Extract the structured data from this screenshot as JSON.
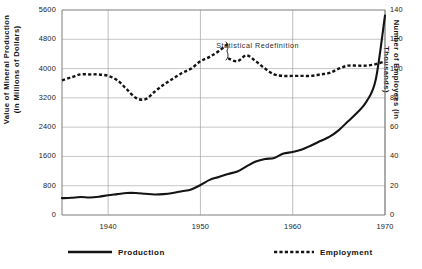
{
  "chart_data": {
    "type": "line",
    "title": "",
    "xlabel": "",
    "ylabel": "Value of Mineral Production\n(in Millions of Dollars)",
    "y2label": "Number of Employees (in Thousands)",
    "xlim": [
      1935,
      1970
    ],
    "ylim": [
      0,
      5600
    ],
    "y2lim": [
      0,
      140
    ],
    "grid": true,
    "legend_position": "bottom",
    "xticks": [
      1940,
      1950,
      1960,
      1970
    ],
    "xtick_labels": [
      "1940",
      "1950",
      "1960",
      "1970"
    ],
    "yticks": [
      0,
      800,
      1600,
      2400,
      3200,
      4000,
      4800,
      5600
    ],
    "ytick_labels": [
      "0",
      "800",
      "1600",
      "2400",
      "3200",
      "4000",
      "4800",
      "5600"
    ],
    "y2ticks": [
      0,
      20,
      40,
      60,
      80,
      100,
      120,
      140
    ],
    "y2tick_labels": [
      "0",
      "20",
      "40",
      "60",
      "80",
      "100",
      "120",
      "140"
    ],
    "annotations": [
      {
        "text": "Statistical Redefinition",
        "x": 1951.5,
        "y2": 116
      }
    ],
    "series": [
      {
        "name": "Production",
        "axis": "left",
        "style": "solid",
        "color": "#141414",
        "x": [
          1935,
          1936,
          1937,
          1938,
          1939,
          1940,
          1941,
          1942,
          1943,
          1944,
          1945,
          1946,
          1947,
          1948,
          1949,
          1950,
          1951,
          1952,
          1953,
          1954,
          1955,
          1956,
          1957,
          1958,
          1959,
          1960,
          1961,
          1962,
          1963,
          1964,
          1965,
          1966,
          1967,
          1968,
          1969,
          1970
        ],
        "y": [
          460,
          470,
          490,
          480,
          500,
          540,
          570,
          600,
          600,
          580,
          560,
          570,
          600,
          650,
          700,
          820,
          960,
          1040,
          1120,
          1190,
          1330,
          1460,
          1530,
          1560,
          1680,
          1720,
          1790,
          1900,
          2020,
          2140,
          2320,
          2560,
          2800,
          3100,
          3700,
          5450
        ]
      },
      {
        "name": "Employment",
        "axis": "right",
        "style": "dashed",
        "color": "#141414",
        "break_at_x": 1953.0,
        "x": [
          1935,
          1936,
          1937,
          1938,
          1939,
          1940,
          1941,
          1942,
          1943,
          1944,
          1945,
          1946,
          1947,
          1948,
          1949,
          1950,
          1951,
          1952,
          1953,
          1953,
          1954,
          1955,
          1956,
          1957,
          1958,
          1959,
          1960,
          1961,
          1962,
          1963,
          1964,
          1965,
          1966,
          1967,
          1968,
          1969,
          1970
        ],
        "y": [
          92,
          94,
          96,
          96,
          96,
          95,
          92,
          86,
          80,
          79,
          84,
          89,
          93,
          97,
          100,
          105,
          108,
          112,
          117,
          107,
          105,
          109,
          105,
          100,
          96,
          95,
          95,
          95,
          95,
          96,
          97,
          100,
          102,
          102,
          102,
          103,
          105
        ]
      }
    ]
  },
  "legend": {
    "production_label": "Production",
    "employment_label": "Employment"
  }
}
